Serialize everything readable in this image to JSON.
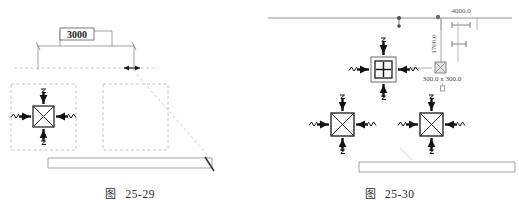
{
  "document": {
    "type": "cad-technical-drawing",
    "background_color": "#ffffff"
  },
  "figures": [
    {
      "id": "figure-25-29",
      "caption_label": "图",
      "caption_number": "25-29",
      "dimension_text": "3000",
      "colors": {
        "dimension_line": "#8c8c8c",
        "dashed_boundary": "#b9b9b9",
        "diffuser_outline": "#1a1a1a",
        "arrow": "#111111",
        "wall_bar": "#9a9a9a"
      },
      "elements": {
        "dimension_label": "3000",
        "diffuser_count": 1,
        "dashed_regions": 2
      }
    },
    {
      "id": "figure-25-30",
      "caption_label": "图",
      "caption_number": "25-30",
      "colors": {
        "dimension_line": "#8c8c8c",
        "diffuser_outline": "#1a1a1a",
        "arrow": "#111111",
        "wall_bar": "#9a9a9a",
        "ghost_icon": "#7d7d7d"
      },
      "dimensions": {
        "horizontal_top": "4000.0",
        "vertical": "1700.0",
        "size_label": "300.0 x 300.0"
      },
      "elements": {
        "diffuser_count": 3,
        "selected_diffuser_index": 0
      }
    }
  ]
}
